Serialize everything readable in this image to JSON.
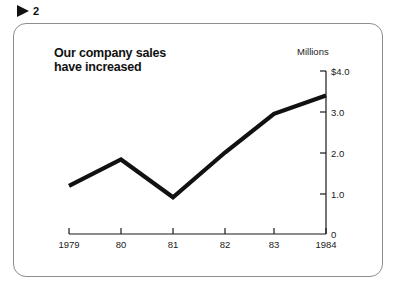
{
  "figure": {
    "marker_icon": "play-triangle-icon",
    "number": "2"
  },
  "card": {
    "title": "Our company sales\nhave increased",
    "unit_label": "Millions"
  },
  "chart_data": {
    "type": "line",
    "title": "Our company sales have increased",
    "xlabel": "",
    "ylabel": "Millions",
    "ylim": [
      0,
      4.0
    ],
    "grid": false,
    "legend": "none",
    "axis_position": "right",
    "categories": [
      "1979",
      "80",
      "81",
      "82",
      "83",
      "1984"
    ],
    "x_tick_labels": [
      "1979",
      "80",
      "81",
      "82",
      "83",
      "1984"
    ],
    "y_tick_labels": [
      "$4.0",
      "3.0",
      "2.0",
      "1.0",
      "0"
    ],
    "y_tick_values": [
      4.0,
      3.0,
      2.0,
      1.0,
      0
    ],
    "series": [
      {
        "name": "Company sales",
        "values": [
          1.18,
          1.83,
          0.9,
          2.0,
          2.95,
          3.4
        ],
        "color": "#111111"
      }
    ]
  }
}
